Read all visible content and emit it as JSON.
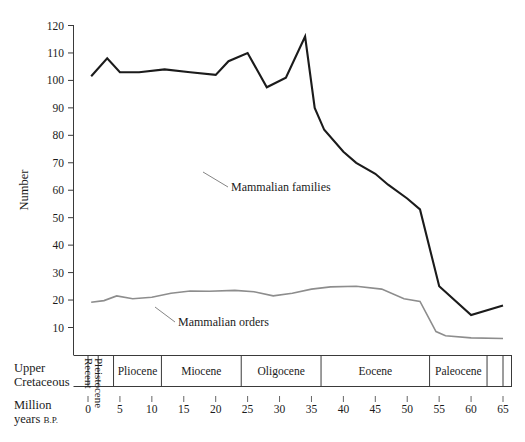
{
  "chart_data": {
    "type": "line",
    "title": "",
    "xlabel": "Million years B.P.",
    "ylabel": "Number",
    "xlim": [
      65,
      0
    ],
    "ylim": [
      0,
      120
    ],
    "x_reversed": true,
    "grid": false,
    "legend_position": "inline-annotations",
    "y_ticks": [
      120,
      110,
      100,
      90,
      80,
      70,
      60,
      50,
      40,
      30,
      20,
      10
    ],
    "x_ticks": [
      65,
      60,
      55,
      50,
      45,
      40,
      35,
      30,
      25,
      20,
      15,
      10,
      5,
      0
    ],
    "epochs": [
      {
        "name": "Upper\nCretaceous",
        "start": 65,
        "end": 62.5,
        "orientation": "horizontal",
        "two_line": true
      },
      {
        "name": "Paleocene",
        "start": 62.5,
        "end": 53.5,
        "orientation": "horizontal",
        "two_line": false
      },
      {
        "name": "Eocene",
        "start": 53.5,
        "end": 36.5,
        "orientation": "horizontal",
        "two_line": false
      },
      {
        "name": "Oligocene",
        "start": 36.5,
        "end": 24.0,
        "orientation": "horizontal",
        "two_line": false
      },
      {
        "name": "Miocene",
        "start": 24.0,
        "end": 11.5,
        "orientation": "horizontal",
        "two_line": false
      },
      {
        "name": "Pliocene",
        "start": 11.5,
        "end": 4.0,
        "orientation": "horizontal",
        "two_line": false
      },
      {
        "name": "Pleistocene",
        "start": 4.0,
        "end": 1.6,
        "orientation": "vertical",
        "two_line": false
      },
      {
        "name": "Recent",
        "start": 1.6,
        "end": 0,
        "orientation": "vertical",
        "two_line": false
      }
    ],
    "series": [
      {
        "name": "Mammalian families",
        "color": "#1b1b1b",
        "label_x": 41.5,
        "label_y": 66,
        "points": [
          {
            "x": 65,
            "y": 18
          },
          {
            "x": 60,
            "y": 14.5
          },
          {
            "x": 55,
            "y": 25
          },
          {
            "x": 52,
            "y": 53
          },
          {
            "x": 50,
            "y": 57
          },
          {
            "x": 47,
            "y": 62
          },
          {
            "x": 45,
            "y": 66
          },
          {
            "x": 42,
            "y": 70
          },
          {
            "x": 40,
            "y": 74
          },
          {
            "x": 37,
            "y": 82
          },
          {
            "x": 35.5,
            "y": 90
          },
          {
            "x": 34,
            "y": 116
          },
          {
            "x": 31,
            "y": 101
          },
          {
            "x": 28,
            "y": 97.5
          },
          {
            "x": 25,
            "y": 110
          },
          {
            "x": 22,
            "y": 107
          },
          {
            "x": 20,
            "y": 102
          },
          {
            "x": 16,
            "y": 103
          },
          {
            "x": 12,
            "y": 104
          },
          {
            "x": 8,
            "y": 103
          },
          {
            "x": 5,
            "y": 103
          },
          {
            "x": 3,
            "y": 108
          },
          {
            "x": 0.5,
            "y": 101.5
          }
        ]
      },
      {
        "name": "Mammalian orders",
        "color": "#8d8d8d",
        "label_x": 51.5,
        "label_y": 14,
        "points": [
          {
            "x": 65,
            "y": 6
          },
          {
            "x": 60,
            "y": 6.2
          },
          {
            "x": 56,
            "y": 7
          },
          {
            "x": 54.5,
            "y": 8.5
          },
          {
            "x": 52,
            "y": 19.5
          },
          {
            "x": 49.5,
            "y": 20.5
          },
          {
            "x": 46,
            "y": 24
          },
          {
            "x": 42,
            "y": 25
          },
          {
            "x": 38,
            "y": 24.8
          },
          {
            "x": 35,
            "y": 24
          },
          {
            "x": 32,
            "y": 22.5
          },
          {
            "x": 29,
            "y": 21.5
          },
          {
            "x": 26,
            "y": 23
          },
          {
            "x": 23,
            "y": 23.5
          },
          {
            "x": 19,
            "y": 23.2
          },
          {
            "x": 16,
            "y": 23.3
          },
          {
            "x": 13,
            "y": 22.5
          },
          {
            "x": 10,
            "y": 21
          },
          {
            "x": 7,
            "y": 20.5
          },
          {
            "x": 4.5,
            "y": 21.5
          },
          {
            "x": 2.5,
            "y": 19.8
          },
          {
            "x": 0.5,
            "y": 19.2
          }
        ]
      }
    ]
  },
  "axis": {
    "y_title": "Number",
    "scale_row_label_line1": "Million",
    "scale_row_label_line2a": "years ",
    "scale_row_label_line2b": "B.P.",
    "epoch_first_line1": "Upper",
    "epoch_first_line2": "Cretaceous"
  },
  "colors": {
    "families_line": "#1b1b1b",
    "orders_line": "#8d8d8d",
    "axis": "#3a3a3a",
    "background": "#ffffff"
  }
}
